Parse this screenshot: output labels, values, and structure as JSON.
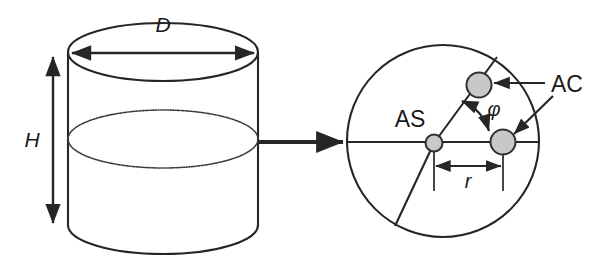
{
  "figure": {
    "background_color": "#ffffff",
    "stroke_color": "#262626",
    "marker_fill_color": "#c8c8c8",
    "marker_stroke_color": "#303030"
  },
  "left_view": {
    "name": "cylinder-side-view",
    "dimensions": [
      {
        "key": "diameter",
        "label": "D",
        "style": "italic",
        "annotation": "double-headed horizontal arrow across top ellipse"
      },
      {
        "key": "height",
        "label": "H",
        "style": "italic",
        "annotation": "double-headed vertical arrow at left side"
      }
    ],
    "features": [
      {
        "name": "top-ellipse-rim",
        "description": "upper rim of cylinder"
      },
      {
        "name": "liquid-level-ellipse",
        "description": "inner dotted ellipse - liquid surface"
      },
      {
        "name": "bottom-ellipse-rim",
        "description": "lower rim of cylinder"
      }
    ]
  },
  "connector": {
    "name": "expand-arrow",
    "description": "arrow from cylinder to top-view detail",
    "direction": "right"
  },
  "right_view": {
    "name": "cylinder-top-view",
    "labels": [
      {
        "key": "as",
        "text": "AS",
        "style": "regular",
        "meaning": "agitator shaft position at center"
      },
      {
        "key": "ac",
        "text": "AC",
        "style": "regular",
        "meaning": "agitator cell positions",
        "arrow_count": 2
      },
      {
        "key": "phi",
        "text": "φ",
        "style": "italic",
        "meaning": "angular separation between agitator cells"
      },
      {
        "key": "r",
        "text": "r",
        "style": "italic",
        "meaning": "radial distance from shaft to agitator cell"
      }
    ],
    "markers": [
      {
        "name": "marker-as",
        "label": "AS",
        "role": "shaft-center"
      },
      {
        "name": "marker-ac-upper",
        "label": "AC",
        "role": "agitator-cell"
      },
      {
        "name": "marker-ac-right",
        "label": "AC",
        "role": "agitator-cell"
      }
    ],
    "dimension": {
      "key": "radius",
      "label": "r",
      "annotation": "double-headed horizontal arrow from shaft to right agitator cell"
    },
    "angle": {
      "key": "phi",
      "label": "φ",
      "annotation": "double-headed curved arrow between the two agitator cells"
    }
  }
}
